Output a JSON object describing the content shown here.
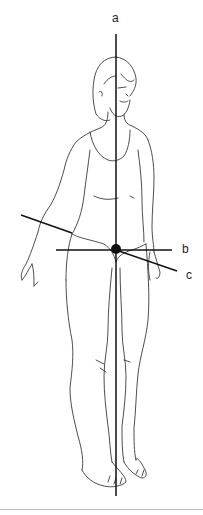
{
  "figure": {
    "axes": [
      {
        "label": "a",
        "orientation": "vertical (longitudinal)"
      },
      {
        "label": "b",
        "orientation": "horizontal (transverse)"
      },
      {
        "label": "c",
        "orientation": "oblique (sagittal)"
      }
    ],
    "colors": {
      "line": "#111111",
      "sketch": "#333333",
      "rule": "#bdbdbd"
    }
  }
}
